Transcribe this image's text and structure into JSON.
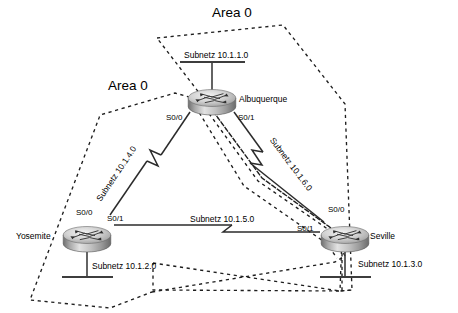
{
  "diagram": {
    "type": "network-topology",
    "background_color": "#ffffff",
    "line_color": "#333333",
    "dash_color": "#222222"
  },
  "areas": [
    {
      "id": "area-right",
      "label": "Area 0",
      "x": 212,
      "y": 6
    },
    {
      "id": "area-left",
      "label": "Area 0",
      "x": 108,
      "y": 79
    }
  ],
  "routers": [
    {
      "id": "albuquerque",
      "name": "Albuquerque",
      "x": 212,
      "y": 98,
      "label_x": 239,
      "label_y": 95,
      "interfaces": [
        {
          "name": "S0/0",
          "x": 168,
          "y": 116
        },
        {
          "name": "S0/1",
          "x": 238,
          "y": 116
        }
      ]
    },
    {
      "id": "yosemite",
      "name": "Yosemite",
      "x": 87,
      "y": 235,
      "label_x": 16,
      "label_y": 232,
      "interfaces": [
        {
          "name": "S0/0",
          "x": 78,
          "y": 212
        },
        {
          "name": "S0/1",
          "x": 110,
          "y": 218
        }
      ]
    },
    {
      "id": "seville",
      "name": "Seville",
      "x": 345,
      "y": 235,
      "label_x": 370,
      "label_y": 235,
      "interfaces": [
        {
          "name": "S0/0",
          "x": 330,
          "y": 209
        },
        {
          "name": "S0/1",
          "x": 299,
          "y": 228
        }
      ]
    }
  ],
  "subnets": [
    {
      "id": "subnet-10-1-1-0",
      "label": "Subnetz 10.1.1.0",
      "x": 184,
      "y": 51,
      "rotation": 0
    },
    {
      "id": "subnet-10-1-2-0",
      "label": "Subnetz 10.1.2.0",
      "x": 92,
      "y": 262,
      "rotation": 0
    },
    {
      "id": "subnet-10-1-3-0",
      "label": "Subnetz 10.1.3.0",
      "x": 358,
      "y": 263,
      "rotation": 0
    },
    {
      "id": "subnet-10-1-4-0",
      "label": "Subnetz 10.1.4.0",
      "x": 95,
      "y": 198,
      "rotation": -56
    },
    {
      "id": "subnet-10-1-5-0",
      "label": "Subnetz 10.1.5.0",
      "x": 190,
      "y": 217,
      "rotation": 0
    },
    {
      "id": "subnet-10-1-6-0",
      "label": "Subnetz 10.1.6.0",
      "x": 275,
      "y": 136,
      "rotation": 53
    }
  ],
  "links": [
    {
      "id": "link-albuquerque-yosemite",
      "from": "albuquerque",
      "to": "yosemite",
      "subnet": "Subnetz 10.1.4.0",
      "serial": true
    },
    {
      "id": "link-albuquerque-seville",
      "from": "albuquerque",
      "to": "seville",
      "subnet": "Subnetz 10.1.6.0",
      "serial": true
    },
    {
      "id": "link-yosemite-seville",
      "from": "yosemite",
      "to": "seville",
      "subnet": "Subnetz 10.1.5.0",
      "serial": true
    }
  ],
  "lan_segments": [
    {
      "id": "lan-albuquerque",
      "router": "albuquerque",
      "subnet": "Subnetz 10.1.1.0"
    },
    {
      "id": "lan-yosemite",
      "router": "yosemite",
      "subnet": "Subnetz 10.1.2.0"
    },
    {
      "id": "lan-seville",
      "router": "seville",
      "subnet": "Subnetz 10.1.3.0"
    }
  ]
}
